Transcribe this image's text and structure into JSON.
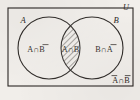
{
  "figure": {
    "background_color": "#f1eeea",
    "ink_color": "#2b2724"
  },
  "universe": {
    "label": "U",
    "name": "universal-set",
    "rect": {
      "x": 8,
      "y": 8,
      "width": 125,
      "height": 78
    }
  },
  "sets": [
    {
      "id": "A",
      "label": "A",
      "cx": 49,
      "cy": 48,
      "r": 31
    },
    {
      "id": "B",
      "label": "B",
      "cx": 92,
      "cy": 48,
      "r": 31
    }
  ],
  "regions": [
    {
      "id": "a-only",
      "label_base": "A",
      "operator": "∩",
      "label_complement": "B",
      "label_full": "A∩B̄",
      "shaded": false,
      "x": 36,
      "y": 50
    },
    {
      "id": "intersection",
      "label_base": "A",
      "operator": "∩",
      "label_complement": "B",
      "label_full": "A∩B",
      "shaded": true,
      "hatch": "diagonal",
      "x": 70.5,
      "y": 50
    },
    {
      "id": "b-only",
      "label_base": "B",
      "operator": "∩",
      "label_complement": "A",
      "label_full": "B∩Ā",
      "shaded": false,
      "x": 104,
      "y": 50
    },
    {
      "id": "neither",
      "label_base": "A",
      "operator": "∩",
      "label_complement": "B",
      "label_full": "Ā∩B̄",
      "shaded": false,
      "x": 121,
      "y": 81
    }
  ],
  "glyphs": {
    "intersection": "∩",
    "letter_a": "A",
    "letter_b": "B",
    "letter_u": "U"
  }
}
